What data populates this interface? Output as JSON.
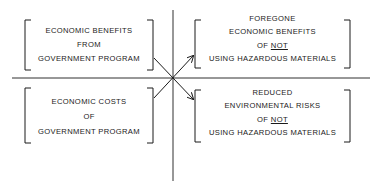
{
  "diagram": {
    "type": "quadrant-comparison",
    "colors": {
      "ink": "#1a1a1a",
      "background": "#ffffff"
    },
    "quadrants": {
      "top_left": {
        "lines": [
          "ECONOMIC BENEFITS",
          "FROM",
          "GOVERNMENT PROGRAM"
        ]
      },
      "bottom_left": {
        "lines": [
          "ECONOMIC COSTS",
          "OF",
          "GOVERNMENT PROGRAM"
        ]
      },
      "top_right": {
        "line1": "FOREGONE",
        "line2": "ECONOMIC BENEFITS",
        "line3_prefix": "OF",
        "line3_emphasis": "NOT",
        "line4": "USING HAZARDOUS MATERIALS"
      },
      "bottom_right": {
        "line1": "REDUCED",
        "line2": "ENVIRONMENTAL RISKS",
        "line3_prefix": "OF",
        "line3_emphasis": "NOT",
        "line4": "USING HAZARDOUS MATERIALS"
      }
    },
    "connectors": [
      {
        "from": "top_left",
        "to": "bottom_right",
        "arrow": "end"
      },
      {
        "from": "bottom_left",
        "to": "top_right",
        "arrow": "end"
      }
    ]
  }
}
